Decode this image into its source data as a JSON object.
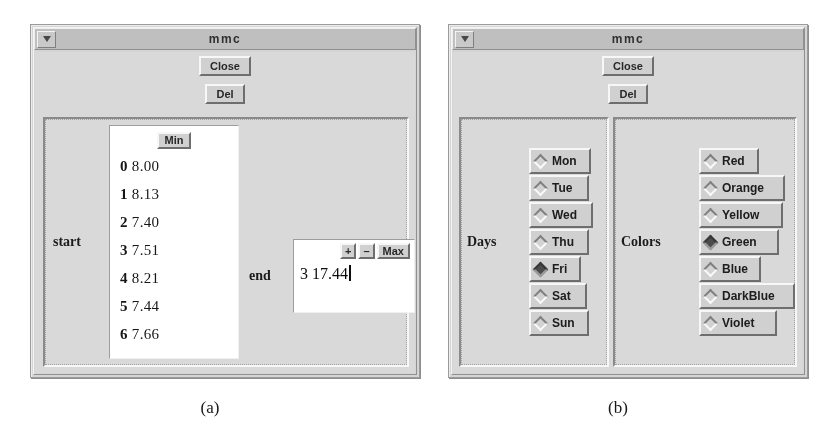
{
  "figure": {
    "caption_a": "(a)",
    "caption_b": "(b)"
  },
  "window_a": {
    "title": "mmc",
    "menu_icon": "window-menu-triangle-icon",
    "buttons": {
      "close": "Close",
      "del": "Del"
    },
    "start_group": {
      "label": "start",
      "header_button": "Min",
      "rows": [
        {
          "index": "0",
          "value": "8.00"
        },
        {
          "index": "1",
          "value": "8.13"
        },
        {
          "index": "2",
          "value": "7.40"
        },
        {
          "index": "3",
          "value": "7.51"
        },
        {
          "index": "4",
          "value": "8.21"
        },
        {
          "index": "5",
          "value": "7.44"
        },
        {
          "index": "6",
          "value": "7.66"
        }
      ]
    },
    "end_group": {
      "label": "end",
      "buttons": {
        "plus": "+",
        "minus": "–",
        "max": "Max"
      },
      "value_index": "3",
      "value": "17.44",
      "value_display": "3 17.44",
      "has_text_cursor": true
    }
  },
  "window_b": {
    "title": "mmc",
    "menu_icon": "window-menu-triangle-icon",
    "buttons": {
      "close": "Close",
      "del": "Del"
    },
    "days_group": {
      "label": "Days",
      "selected": "Fri",
      "options": [
        {
          "label": "Mon",
          "selected": false
        },
        {
          "label": "Tue",
          "selected": false
        },
        {
          "label": "Wed",
          "selected": false
        },
        {
          "label": "Thu",
          "selected": false
        },
        {
          "label": "Fri",
          "selected": true
        },
        {
          "label": "Sat",
          "selected": false
        },
        {
          "label": "Sun",
          "selected": false
        }
      ]
    },
    "colors_group": {
      "label": "Colors",
      "selected": "Green",
      "options": [
        {
          "label": "Red",
          "selected": false
        },
        {
          "label": "Orange",
          "selected": false
        },
        {
          "label": "Yellow",
          "selected": false
        },
        {
          "label": "Green",
          "selected": true
        },
        {
          "label": "Blue",
          "selected": false
        },
        {
          "label": "DarkBlue",
          "selected": false
        },
        {
          "label": "Violet",
          "selected": false
        }
      ]
    }
  },
  "colors": {
    "page_background": "#ffffff",
    "window_face": "#d6d6d6",
    "titlebar": "#bdbdbd",
    "button_face": "#cdcdcd",
    "entry_background": "#fdfdfd",
    "text": "#1a1a1a"
  }
}
